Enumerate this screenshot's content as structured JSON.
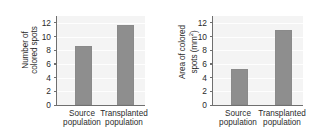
{
  "figure": {
    "background": "#ffffff",
    "bar_color": "#8e8e8e",
    "axis_color": "#6f6f6f",
    "plot_background": "#f4f4f4"
  },
  "chart_data": [
    {
      "type": "bar",
      "panel": "left",
      "title": "",
      "xlabel": "",
      "ylabel": "Number of colored spots",
      "ylabel_line1": "Number of",
      "ylabel_line2": "colored spots",
      "categories": [
        "Source population",
        "Transplanted population"
      ],
      "category_lines": [
        [
          "Source",
          "population"
        ],
        [
          "Transplanted",
          "population"
        ]
      ],
      "values": [
        8.6,
        11.7
      ],
      "ylim": [
        0,
        13
      ],
      "yticks": [
        0,
        2,
        4,
        6,
        8,
        10,
        12
      ],
      "ytick_labels": [
        "0",
        "2",
        "4",
        "6",
        "8",
        "10",
        "12"
      ],
      "grid": true,
      "legend": "none"
    },
    {
      "type": "bar",
      "panel": "right",
      "title": "",
      "xlabel": "",
      "ylabel": "Area of colored spots (mm2)",
      "ylabel_line1": "Area of colored",
      "ylabel_line2_pre": "spots (mm",
      "ylabel_line2_sup": "2",
      "ylabel_line2_post": ")",
      "categories": [
        "Source population",
        "Transplanted population"
      ],
      "category_lines": [
        [
          "Source",
          "population"
        ],
        [
          "Transplanted",
          "population"
        ]
      ],
      "values": [
        5.2,
        10.9
      ],
      "ylim": [
        0,
        13
      ],
      "yticks": [
        0,
        2,
        4,
        6,
        8,
        10,
        12
      ],
      "ytick_labels": [
        "0",
        "2",
        "4",
        "6",
        "8",
        "10",
        "12"
      ],
      "grid": true,
      "legend": "none"
    }
  ]
}
